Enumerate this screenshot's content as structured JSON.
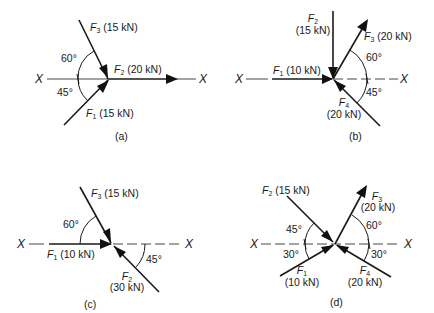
{
  "figure": {
    "axis_label": "X",
    "panels": [
      {
        "id": "a",
        "caption": "(a)",
        "forces": [
          {
            "name": "F",
            "sub": "1",
            "value": "(15 kN)",
            "direction": "toward point, from lower-left at 45° below X"
          },
          {
            "name": "F",
            "sub": "2",
            "value": "(20 kN)",
            "direction": "along X, pointing right"
          },
          {
            "name": "F",
            "sub": "3",
            "value": "(15 kN)",
            "direction": "toward point, from upper-left at 60° above X"
          }
        ],
        "angles": [
          "60°",
          "45°"
        ]
      },
      {
        "id": "b",
        "caption": "(b)",
        "forces": [
          {
            "name": "F",
            "sub": "1",
            "value": "(10 kN)",
            "direction": "along X, pointing right toward point"
          },
          {
            "name": "F",
            "sub": "2",
            "value": "(15 kN)",
            "direction": "vertical, pointing down toward point"
          },
          {
            "name": "F",
            "sub": "3",
            "value": "(20 kN)",
            "direction": "away from point, upper-right at 60° above X"
          },
          {
            "name": "F",
            "sub": "4",
            "value": "(20 kN)",
            "direction": "toward point, from lower-right at 45° below X"
          }
        ],
        "angles": [
          "60°",
          "45°"
        ]
      },
      {
        "id": "c",
        "caption": "(c)",
        "forces": [
          {
            "name": "F",
            "sub": "1",
            "value": "(10 kN)",
            "direction": "along X, pointing right toward point"
          },
          {
            "name": "F",
            "sub": "2",
            "value": "(30 kN)",
            "direction": "toward point, from lower-right at 45° below X"
          },
          {
            "name": "F",
            "sub": "3",
            "value": "(15 kN)",
            "direction": "toward point, from upper-left at 60° above X"
          }
        ],
        "angles": [
          "60°",
          "45°"
        ]
      },
      {
        "id": "d",
        "caption": "(d)",
        "forces": [
          {
            "name": "F",
            "sub": "1",
            "value": "(10 kN)",
            "direction": "toward point, from lower-left at 30° below X"
          },
          {
            "name": "F",
            "sub": "2",
            "value": "(15 kN)",
            "direction": "toward point, from upper-left at 45° above X"
          },
          {
            "name": "F",
            "sub": "3",
            "value": "(20 kN)",
            "direction": "away from point, upper-right at 60° above X"
          },
          {
            "name": "F",
            "sub": "4",
            "value": "(20 kN)",
            "direction": "toward point, from lower-right at 30° below X"
          }
        ],
        "angles": [
          "45°",
          "30°",
          "60°",
          "30°"
        ]
      }
    ]
  }
}
